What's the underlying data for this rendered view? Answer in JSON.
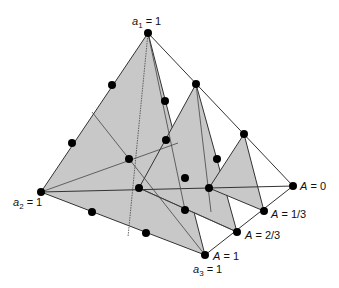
{
  "diagram": {
    "fill_color": "#c8c8c8",
    "line_color": "#333333",
    "dot_color": "#000000",
    "labels": {
      "a1": {
        "var": "a",
        "sub": "1",
        "eq": " = 1"
      },
      "a2": {
        "var": "a",
        "sub": "2",
        "eq": " = 1"
      },
      "a3": {
        "var": "a",
        "sub": "3",
        "eq": " = 1"
      },
      "A0": {
        "var": "A",
        "eq": " = 0"
      },
      "A13": {
        "var": "A",
        "eq": " = 1/3"
      },
      "A23": {
        "var": "A",
        "eq": " = 2/3"
      },
      "A1": {
        "var": "A",
        "eq": " = 1"
      }
    },
    "vertices": {
      "a1": [
        148,
        33
      ],
      "a2": [
        41,
        192
      ],
      "a3": [
        205,
        255
      ],
      "A0": [
        293,
        186
      ],
      "A13": [
        264,
        211
      ],
      "A23": [
        237,
        232
      ],
      "t2_apex": [
        196,
        84
      ],
      "t2_left": [
        139,
        188
      ],
      "t3_apex": [
        244,
        134
      ],
      "t3_left": [
        209,
        188
      ]
    },
    "dots": [
      [
        148,
        33
      ],
      [
        41,
        192
      ],
      [
        205,
        255
      ],
      [
        293,
        186
      ],
      [
        264,
        211
      ],
      [
        237,
        232
      ],
      [
        196,
        84
      ],
      [
        244,
        134
      ],
      [
        112,
        85
      ],
      [
        72,
        143
      ],
      [
        129,
        159
      ],
      [
        165,
        101
      ],
      [
        166,
        140
      ],
      [
        217,
        159
      ],
      [
        139,
        188
      ],
      [
        185,
        178
      ],
      [
        209,
        188
      ],
      [
        185,
        210
      ],
      [
        146,
        233
      ],
      [
        92,
        212
      ]
    ]
  }
}
